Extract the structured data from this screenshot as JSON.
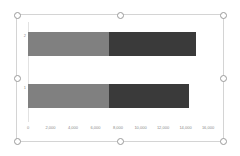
{
  "selection": {
    "label": "chart-selection-frame",
    "handles": [
      "top-left",
      "top-center",
      "top-right",
      "middle-left",
      "middle-right",
      "bottom-left",
      "bottom-center",
      "bottom-right"
    ]
  },
  "colors": {
    "series_1": "#808080",
    "series_2": "#3a3a3a",
    "axis": "#e2e2e2",
    "tick_text": "#8a8a8a",
    "frame": "#d4d4d4",
    "handle_fill": "#ffffff",
    "handle_border": "#9a9a9a"
  },
  "chart_data": {
    "type": "bar",
    "orientation": "horizontal",
    "stacked": true,
    "title": "",
    "subtitle": "",
    "xlabel": "",
    "ylabel": "",
    "categories": [
      "1",
      "2"
    ],
    "series": [
      {
        "name": "Series 1",
        "color": "#808080",
        "values": [
          7200,
          7200
        ]
      },
      {
        "name": "Series 2",
        "color": "#3a3a3a",
        "values": [
          7100,
          7700
        ]
      }
    ],
    "totals": [
      14300,
      14900
    ],
    "xlim": [
      0,
      16000
    ],
    "xticks": [
      0,
      2000,
      4000,
      6000,
      8000,
      10000,
      12000,
      14000,
      16000
    ],
    "xtick_labels": [
      "0",
      "2,000",
      "4,000",
      "6,000",
      "8,000",
      "10,000",
      "12,000",
      "14,000",
      "16,000"
    ],
    "grid": false,
    "legend": false,
    "legend_position": "none"
  }
}
